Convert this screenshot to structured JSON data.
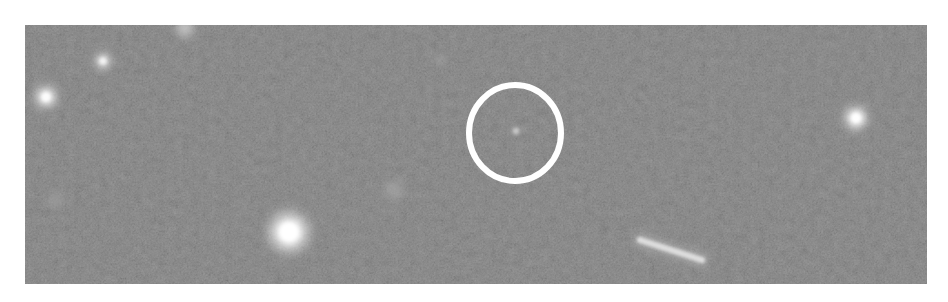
{
  "image": {
    "type": "astronomical-field",
    "description": "Grayscale deep-sky frame with background noise, several bright point sources, an elongated streak and a circled faint target",
    "panel": {
      "x": 25,
      "y": 25,
      "width": 902,
      "height": 259
    },
    "background_color": "#2e2e2e",
    "page_background": "#ffffff"
  },
  "marker": {
    "shape": "circle",
    "color": "#ffffff",
    "center": {
      "x": 515,
      "y": 133
    },
    "radius_x": 46,
    "radius_y": 48,
    "stroke_width": 6,
    "target": {
      "x": 516,
      "y": 131,
      "size": 4
    }
  },
  "sources": [
    {
      "name": "bright-star-lower-left",
      "x": 289,
      "y": 232,
      "r": 17,
      "brightness": 1.0
    },
    {
      "name": "star-right",
      "x": 856,
      "y": 118,
      "r": 10,
      "brightness": 0.95
    },
    {
      "name": "star-left",
      "x": 46,
      "y": 97,
      "r": 10,
      "brightness": 0.85
    },
    {
      "name": "star-upper-left",
      "x": 103,
      "y": 61,
      "r": 8,
      "brightness": 0.7
    },
    {
      "name": "star-top-edge",
      "x": 185,
      "y": 28,
      "r": 10,
      "brightness": 0.5
    },
    {
      "name": "faint-blob-center",
      "x": 394,
      "y": 190,
      "r": 12,
      "brightness": 0.25
    },
    {
      "name": "faint-blob-left",
      "x": 55,
      "y": 200,
      "r": 10,
      "brightness": 0.2
    },
    {
      "name": "faint-dot-upper",
      "x": 440,
      "y": 60,
      "r": 5,
      "brightness": 0.3
    }
  ],
  "streak": {
    "name": "elongated-galaxy-streak",
    "x1": 640,
    "y1": 240,
    "x2": 702,
    "y2": 260,
    "width": 9,
    "brightness": 0.85
  }
}
